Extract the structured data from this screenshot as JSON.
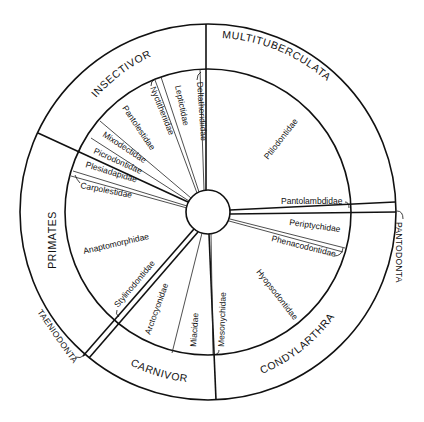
{
  "diagram": {
    "type": "circular phylogenetic/taxonomic wheel",
    "center": {
      "x": 208,
      "y": 212
    },
    "radii": {
      "core": 22,
      "inner": 143,
      "outer": 188
    },
    "orders": [
      {
        "id": "multituberculata",
        "label": "MULTITUBERCULATA"
      },
      {
        "id": "insectivora",
        "label": "INSECTIVORA"
      },
      {
        "id": "primates",
        "label": "PRIMATES"
      },
      {
        "id": "carnivora",
        "label": "CARNIVORA"
      },
      {
        "id": "condylarthra",
        "label": "CONDYLARTHRA"
      },
      {
        "id": "pantodonta",
        "label": "PANTODONTA"
      },
      {
        "id": "taeniodonta",
        "label": "TAENIODONTA"
      }
    ],
    "families": [
      {
        "id": "ptilodontidae",
        "label": "Ptilodontidae",
        "order": "MULTITUBERCULATA"
      },
      {
        "id": "deltatheridiidae",
        "label": "Deltatheridiidae",
        "order": "INSECTIVORA"
      },
      {
        "id": "leptictidae",
        "label": "Leptictidae",
        "order": "INSECTIVORA"
      },
      {
        "id": "nyctitheriidae",
        "label": "Nyctitheriidae",
        "order": "INSECTIVORA"
      },
      {
        "id": "pantolestidae",
        "label": "Pantolestidae",
        "order": "INSECTIVORA"
      },
      {
        "id": "mixodectidae",
        "label": "Mixodectidae",
        "order": "INSECTIVORA"
      },
      {
        "id": "picrodontidae",
        "label": "Picrodontidae",
        "order": "PRIMATES"
      },
      {
        "id": "plesiadapidae",
        "label": "Plesiadapidae",
        "order": "PRIMATES"
      },
      {
        "id": "carpolestidae",
        "label": "Carpolestidae",
        "order": "PRIMATES"
      },
      {
        "id": "anaptomorphidae",
        "label": "Anaptomorphidae",
        "order": "PRIMATES"
      },
      {
        "id": "stylinodontidae",
        "label": "Stylinodontidae",
        "order": "TAENIODONTA"
      },
      {
        "id": "arctocyonidae",
        "label": "Arctocyonidae",
        "order": "CARNIVORA"
      },
      {
        "id": "miacidae",
        "label": "Miacidae",
        "order": "CARNIVORA"
      },
      {
        "id": "mesonychidae",
        "label": "Mesonychidae",
        "order": "CONDYLARTHRA"
      },
      {
        "id": "hyopsodontidae",
        "label": "Hyopsodontidae",
        "order": "CONDYLARTHRA"
      },
      {
        "id": "phenacodontidae",
        "label": "Phenacodontidae",
        "order": "CONDYLARTHRA"
      },
      {
        "id": "periptychidae",
        "label": "Periptychidae",
        "order": "CONDYLARTHRA"
      },
      {
        "id": "pantolambdidae",
        "label": "Pantolambdidae",
        "order": "PANTODONTA"
      }
    ]
  },
  "labels": {
    "multituberculata": "MULTITUBERCULATA",
    "insectivora": "INSECTIVORA",
    "primates": "PRIMATES",
    "carnivora": "CARNIVORA",
    "condylarthra": "CONDYLARTHRA",
    "pantodonta": "PANTODONTA",
    "taeniodonta": "TAENIODONTA",
    "ptilodontidae": "Ptilodontidae",
    "deltatheridiidae": "Deltatheridiidae",
    "leptictidae": "Leptictidae",
    "nyctitheriidae": "Nyctitheriidae",
    "pantolestidae": "Pantolestidae",
    "mixodectidae": "Mixodectidae",
    "picrodontidae": "Picrodontidae",
    "plesiadapidae": "Plesiadapidae",
    "carpolestidae": "Carpolestidae",
    "anaptomorphidae": "Anaptomorphidae",
    "stylinodontidae": "Stylinodontidae",
    "arctocyonidae": "Arctocyonidae",
    "miacidae": "Miacidae",
    "mesonychidae": "Mesonychidae",
    "hyopsodontidae": "Hyopsodontidae",
    "phenacodontidae": "Phenacodontidae",
    "periptychidae": "Periptychidae",
    "pantolambdidae": "Pantolambdidae"
  }
}
